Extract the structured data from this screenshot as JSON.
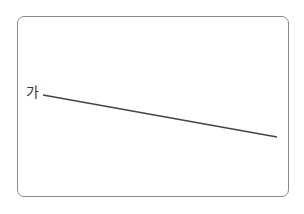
{
  "diagram": {
    "label": "가",
    "line": {
      "x1": 43,
      "y1": 95,
      "x2": 277,
      "y2": 137,
      "color": "#444444"
    },
    "frame_color": "#8a8a8a"
  }
}
